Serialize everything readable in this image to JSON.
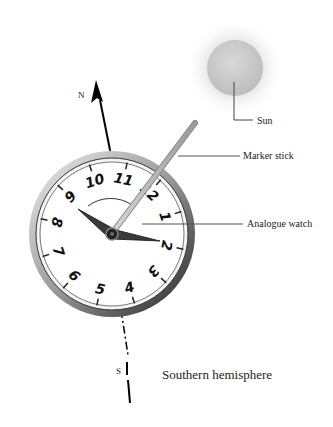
{
  "diagram": {
    "title": "Southern hemisphere",
    "labels": {
      "sun": "Sun",
      "marker_stick": "Marker stick",
      "analogue_watch": "Analogue watch",
      "north": "N",
      "south": "S"
    },
    "watch_numbers": [
      "12",
      "1",
      "2",
      "3",
      "4",
      "5",
      "6",
      "7",
      "8",
      "9",
      "10",
      "11"
    ],
    "colors": {
      "sun": "#c9c9c9",
      "stick": "#b5b5b5",
      "bezel": "#555555",
      "line": "#000000"
    }
  }
}
